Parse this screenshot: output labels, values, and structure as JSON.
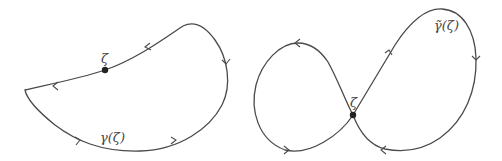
{
  "figure": {
    "left": {
      "curve_label": "γ(ζ)",
      "point_label": "ζ",
      "description": "simple closed curve through point ζ"
    },
    "right": {
      "curve_label": "γ̃(ζ)",
      "point_label": "ζ",
      "description": "figure-eight closed curve with self-intersection at ζ"
    },
    "colors": {
      "stroke": "#4a4a4a",
      "point": "#222222",
      "background": "#ffffff"
    }
  }
}
